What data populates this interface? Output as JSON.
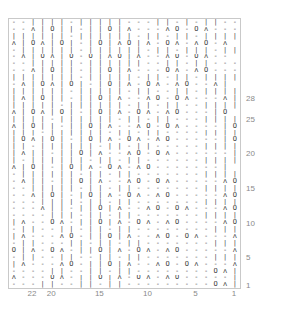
{
  "chart_data": {
    "type": "table",
    "xlabel": "Stitch number",
    "ylabel": "Row number",
    "grid": true,
    "columns": 24,
    "rows": 39,
    "legend": [
      {
        "symbol": "-",
        "name": "purl"
      },
      {
        "symbol": "|",
        "name": "knit"
      },
      {
        "symbol": "O",
        "name": "yarn-over"
      },
      {
        "symbol": "∧",
        "name": "double-decrease"
      },
      {
        "symbol": "ʌ",
        "name": "decrease"
      }
    ],
    "column_ticks": [
      {
        "value": 22,
        "index": 22
      },
      {
        "value": 20,
        "index": 20
      },
      {
        "value": 15,
        "index": 15
      },
      {
        "value": 10,
        "index": 10
      },
      {
        "value": 5,
        "index": 5
      },
      {
        "value": 1,
        "index": 1
      }
    ],
    "row_ticks": [
      {
        "value": 28,
        "index": 28
      },
      {
        "value": 25,
        "index": 25
      },
      {
        "value": 20,
        "index": 20
      },
      {
        "value": 15,
        "index": 15
      },
      {
        "value": 10,
        "index": 10
      },
      {
        "value": 5,
        "index": 5
      },
      {
        "value": 1,
        "index": 1
      }
    ],
    "cells": [
      "--||||-|||||---||-|-||--",
      "--ʌ|O||-||O|ʌ---ʌO-Oʌ---",
      "||||||-||||||-||-||-||||",
      "ʌ|Oʌ|O|-|O|ʌO|ʌ-Oʌ-ʌO-ʌ",
      "-||||||-||||||-||-|||-||",
      "-ʌ|Oʌ|O-O|ʌO|ʌ--ʌO-Oʌ--",
      "--|||||-||||||--||-||---",
      "--ʌ|O||-||O|ʌ---Oʌ-ʌO---",
      "|||||||-|||||-||-||-||||",
      "-ʌ|Oʌ|O|-|O|ʌ-Oʌ-ʌO--ʌ|",
      "||||||-|||||-||--||-||||",
      "|ʌ|O||-||O|ʌ--ʌO-Oʌ---ʌ|",
      "|||||-||||||-||-||--||||",
      "ʌ|Oʌ|O|-|O|ʌ-Oʌ-ʌO---|O",
      "||||-||||||-||-||---||||",
      "ʌ|O||-||O|ʌ--ʌO-Oʌ----|O",
      "|||-||||||-||-||----||||",
      "|Oʌ|O|-|O|ʌ-Oʌ-ʌO-----|O",
      "||-||||||-||-||-----||||",
      "|ʌ||-||O|ʌ--ʌO-Oʌ------|",
      "|-||||||-||-||------||||",
      "ʌ|O|-|O|ʌ-Oʌ-ʌO-------|",
      "-||||||-||-||-------||||",
      "-ʌ||-||O|ʌ--ʌO-Oʌ-----ʌO",
      "--|||||-||-||-------||||",
      "--ʌ|O|-|O|ʌ-Oʌ-ʌO-----ʌO",
      "---||||-||-||-------||||",
      "---ʌ||-||O|ʌ--ʌO-Oʌ---ʌO",
      "----|||-||-||-------||||",
      "|ʌ--Oʌ-||O|ʌ-Oʌ-ʌO----ʌO",
      "-||--||-||-||--------|||",
      "|ʌ---ʌO-||O|ʌ--ʌO-Oʌ---ʌO",
      "-||---||-||-||-------|||",
      "O|ʌ-Oʌ-||O|ʌ-Oʌ-ʌO-----ʌO",
      "-||--||--||-||-------|||",
      "|ʌ---ʌO-||O|ʌ--ʌO-Oʌ---ʌO",
      "----||--||-||--------Oʌ|",
      "ʌ---Oʌ-||O|ʌ-Oʌ-ʌO-----|||",
      "---||--||-||---------Oʌ|"
    ]
  }
}
